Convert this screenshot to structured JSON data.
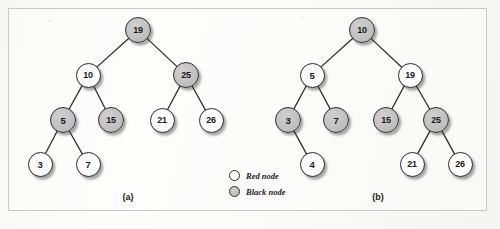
{
  "figure": {
    "kind": "red-black-tree-diagram",
    "background_color": "#fcfcfb",
    "frame_color": "#c9c9c7",
    "red_node_fill": "#ffffff",
    "black_node_fill": "#c3c3c3",
    "node_outline": "#2b2b2b",
    "edge_color": "#2f2f2f"
  },
  "legend": {
    "items": [
      {
        "swatch": "red",
        "label": "Red node"
      },
      {
        "swatch": "black",
        "label": "Black node"
      }
    ]
  },
  "panels": [
    {
      "id": "a",
      "caption": "(a)",
      "caption_x": 128,
      "caption_y": 198,
      "nodes": [
        {
          "id": "a19",
          "key": "19",
          "color": "black",
          "x": 138,
          "y": 30,
          "r": 13
        },
        {
          "id": "a10",
          "key": "10",
          "color": "red",
          "x": 88,
          "y": 75,
          "r": 12.5
        },
        {
          "id": "a25",
          "key": "25",
          "color": "black",
          "x": 186,
          "y": 75,
          "r": 13
        },
        {
          "id": "a5",
          "key": "5",
          "color": "black",
          "x": 63,
          "y": 120,
          "r": 13
        },
        {
          "id": "a15",
          "key": "15",
          "color": "black",
          "x": 111,
          "y": 120,
          "r": 13
        },
        {
          "id": "a21",
          "key": "21",
          "color": "red",
          "x": 162,
          "y": 120,
          "r": 12.5
        },
        {
          "id": "a26",
          "key": "26",
          "color": "red",
          "x": 211,
          "y": 120,
          "r": 12.5
        },
        {
          "id": "a3",
          "key": "3",
          "color": "red",
          "x": 40,
          "y": 164,
          "r": 12.5
        },
        {
          "id": "a7",
          "key": "7",
          "color": "red",
          "x": 88,
          "y": 164,
          "r": 12.5
        }
      ],
      "edges": [
        [
          "a19",
          "a10"
        ],
        [
          "a19",
          "a25"
        ],
        [
          "a10",
          "a5"
        ],
        [
          "a10",
          "a15"
        ],
        [
          "a25",
          "a21"
        ],
        [
          "a25",
          "a26"
        ],
        [
          "a5",
          "a3"
        ],
        [
          "a5",
          "a7"
        ]
      ]
    },
    {
      "id": "b",
      "caption": "(b)",
      "caption_x": 378,
      "caption_y": 198,
      "nodes": [
        {
          "id": "b10",
          "key": "10",
          "color": "black",
          "x": 362,
          "y": 30,
          "r": 13
        },
        {
          "id": "b5",
          "key": "5",
          "color": "red",
          "x": 312,
          "y": 75,
          "r": 12.5
        },
        {
          "id": "b19",
          "key": "19",
          "color": "red",
          "x": 410,
          "y": 75,
          "r": 12.5
        },
        {
          "id": "b3",
          "key": "3",
          "color": "black",
          "x": 288,
          "y": 120,
          "r": 13
        },
        {
          "id": "b7",
          "key": "7",
          "color": "black",
          "x": 336,
          "y": 120,
          "r": 13
        },
        {
          "id": "b15",
          "key": "15",
          "color": "black",
          "x": 386,
          "y": 120,
          "r": 13
        },
        {
          "id": "b25",
          "key": "25",
          "color": "black",
          "x": 436,
          "y": 120,
          "r": 13
        },
        {
          "id": "b4",
          "key": "4",
          "color": "red",
          "x": 312,
          "y": 164,
          "r": 12.5
        },
        {
          "id": "b21",
          "key": "21",
          "color": "red",
          "x": 412,
          "y": 164,
          "r": 12.5
        },
        {
          "id": "b26",
          "key": "26",
          "color": "red",
          "x": 460,
          "y": 164,
          "r": 12.5
        }
      ],
      "edges": [
        [
          "b10",
          "b5"
        ],
        [
          "b10",
          "b19"
        ],
        [
          "b5",
          "b3"
        ],
        [
          "b5",
          "b7"
        ],
        [
          "b19",
          "b15"
        ],
        [
          "b19",
          "b25"
        ],
        [
          "b3",
          "b4"
        ],
        [
          "b25",
          "b21"
        ],
        [
          "b25",
          "b26"
        ]
      ]
    }
  ],
  "legend_layout": {
    "x": 229,
    "row1_y": 176,
    "row2_y": 192
  }
}
